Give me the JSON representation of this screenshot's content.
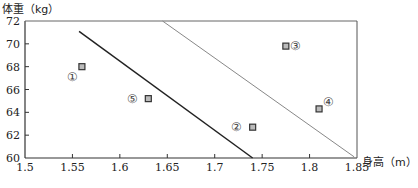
{
  "chart_data": {
    "type": "scatter",
    "title": "",
    "xlabel": "身高（m）",
    "ylabel": "体重（kg）",
    "xlim": [
      1.5,
      1.85
    ],
    "ylim": [
      60,
      72
    ],
    "xticks": [
      1.5,
      1.55,
      1.6,
      1.65,
      1.7,
      1.75,
      1.8,
      1.85
    ],
    "xtick_labels": [
      "1.5",
      "1.55",
      "1.6",
      "1.65",
      "1.7",
      "1.75",
      "1.8",
      "1.85"
    ],
    "yticks": [
      60,
      62,
      64,
      66,
      68,
      70,
      72
    ],
    "ytick_labels": [
      "60",
      "62",
      "64",
      "66",
      "68",
      "70",
      "72"
    ],
    "grid": false,
    "points": [
      {
        "label": "①",
        "x": 1.56,
        "y": 68.0,
        "label_pos": "below-left"
      },
      {
        "label": "②",
        "x": 1.74,
        "y": 62.7,
        "label_pos": "left"
      },
      {
        "label": "③",
        "x": 1.775,
        "y": 69.8,
        "label_pos": "right"
      },
      {
        "label": "④",
        "x": 1.81,
        "y": 64.3,
        "label_pos": "upper-right"
      },
      {
        "label": "⑤",
        "x": 1.63,
        "y": 65.2,
        "label_pos": "left"
      }
    ],
    "lines": [
      {
        "name": "dark-line",
        "color": "#222222",
        "x1": 1.557,
        "y1": 71.1,
        "x2": 1.74,
        "y2": 60.0
      },
      {
        "name": "gray-line",
        "color": "#888888",
        "x1": 1.645,
        "y1": 72.0,
        "x2": 1.847,
        "y2": 60.1
      }
    ]
  }
}
